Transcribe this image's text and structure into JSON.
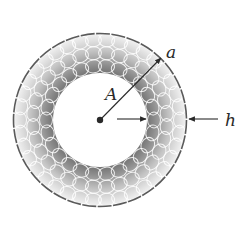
{
  "diagram": {
    "type": "annular cross-section (ring of circular cells)",
    "labels": {
      "outer_radius": "a",
      "inner_radius": "A",
      "thickness": "h"
    },
    "geometry": {
      "center": [
        100,
        120
      ],
      "outer_radius_px": 87,
      "inner_radius_px": 47
    },
    "colors": {
      "ring_dark": "#6e6e6e",
      "ring_light": "#f2f2f2",
      "outline": "#5a5a5a",
      "arrows": "#2a2a2a",
      "background": "#ffffff"
    }
  }
}
